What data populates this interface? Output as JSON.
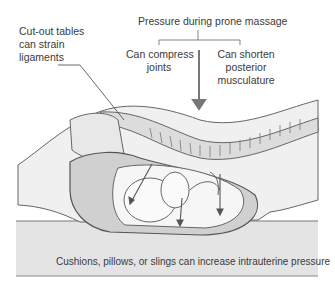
{
  "labels": {
    "cutout": [
      "Cut-out tables",
      "can strain",
      "ligaments"
    ],
    "pressure_title": "Pressure during prone massage",
    "compress": [
      "Can compress",
      "joints"
    ],
    "shorten": [
      "Can shorten",
      "posterior",
      "musculature"
    ],
    "cushions": "Cushions, pillows, or slings can increase intrauterine pressure"
  },
  "colors": {
    "line": "#555555",
    "tissue": "#e6e6e6",
    "table": "#e2e2e2",
    "fluid": "#c8c8c8"
  }
}
